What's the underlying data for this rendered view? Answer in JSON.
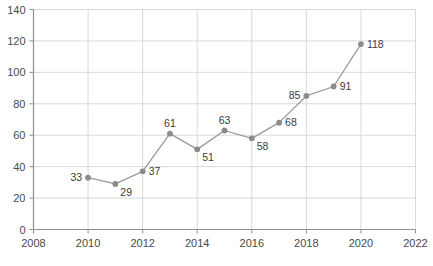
{
  "chart_data": {
    "type": "line",
    "title": "",
    "subtitle": "",
    "xlabel": "",
    "ylabel": "",
    "x": [
      2010,
      2011,
      2012,
      2013,
      2014,
      2015,
      2016,
      2017,
      2018,
      2019,
      2020
    ],
    "values": [
      33,
      29,
      37,
      61,
      51,
      63,
      58,
      68,
      85,
      91,
      118
    ],
    "point_labels": [
      "33",
      "29",
      "37",
      "61",
      "51",
      "63",
      "58",
      "68",
      "85",
      "91",
      "118"
    ],
    "label_placement": [
      "left",
      "below-right",
      "right",
      "above",
      "below-right",
      "above",
      "below-right",
      "right",
      "left",
      "right",
      "right"
    ],
    "xlim": [
      2008,
      2022
    ],
    "ylim": [
      0,
      140
    ],
    "xticks": [
      2008,
      2010,
      2012,
      2014,
      2016,
      2018,
      2020,
      2022
    ],
    "xtick_labels": [
      "2008",
      "2010",
      "2012",
      "2014",
      "2016",
      "2018",
      "2020",
      "2022"
    ],
    "yticks": [
      0,
      20,
      40,
      60,
      80,
      100,
      120,
      140
    ],
    "ytick_labels": [
      "0",
      "20",
      "40",
      "60",
      "80",
      "100",
      "120",
      "140"
    ],
    "grid": true,
    "legend": null,
    "series": [
      {
        "name": "series-1",
        "values": [
          33,
          29,
          37,
          61,
          51,
          63,
          58,
          68,
          85,
          91,
          118
        ]
      }
    ],
    "colors": {
      "line": "#9a9a9a",
      "marker": "#8b8b8b",
      "grid": "#d9d9d9",
      "axis": "#8f8f8f",
      "text": "#3c3c3c",
      "background": "#ffffff"
    }
  }
}
